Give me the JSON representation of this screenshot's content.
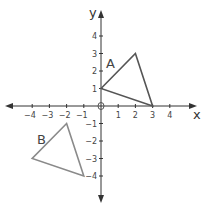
{
  "diagram": {
    "type": "coordinate-plane",
    "axes": {
      "x_label": "x",
      "y_label": "y",
      "origin_label": "0",
      "x_ticks": [
        {
          "value": -4,
          "label": "−4"
        },
        {
          "value": -3,
          "label": "−3"
        },
        {
          "value": -2,
          "label": "−2"
        },
        {
          "value": -1,
          "label": "−1"
        },
        {
          "value": 1,
          "label": "1"
        },
        {
          "value": 2,
          "label": "2"
        },
        {
          "value": 3,
          "label": "3"
        },
        {
          "value": 4,
          "label": "4"
        }
      ],
      "y_ticks": [
        {
          "value": 4,
          "label": "4"
        },
        {
          "value": 3,
          "label": "3"
        },
        {
          "value": 2,
          "label": "2"
        },
        {
          "value": 1,
          "label": "1"
        },
        {
          "value": -1,
          "label": "−1"
        },
        {
          "value": -2,
          "label": "−2"
        },
        {
          "value": -3,
          "label": "−3"
        },
        {
          "value": -4,
          "label": "−4"
        }
      ]
    },
    "shapes": [
      {
        "name": "A",
        "label": "A",
        "vertices": [
          [
            0,
            1
          ],
          [
            2,
            3
          ],
          [
            3,
            0
          ]
        ],
        "color": "#555555"
      },
      {
        "name": "B",
        "label": "B",
        "vertices": [
          [
            -2,
            -1
          ],
          [
            -4,
            -3
          ],
          [
            -1,
            -4
          ]
        ],
        "color": "#8a8a8a"
      }
    ]
  }
}
